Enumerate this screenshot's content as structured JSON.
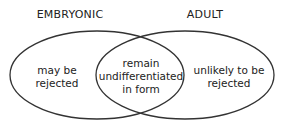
{
  "diagram": {
    "type": "venn",
    "sets": [
      {
        "label": "EMBRYONIC",
        "only_text": "may be rejected"
      },
      {
        "label": "ADULT",
        "only_text": "unlikely to be rejected"
      }
    ],
    "intersection_text": "remain undifferentiated in form"
  },
  "labels": {
    "left_title": "EMBRYONIC",
    "right_title": "ADULT",
    "left_line1": "may be",
    "left_line2": "rejected",
    "mid_line1": "remain",
    "mid_line2": "undifferentiated",
    "mid_line3": "in form",
    "right_line1": "unlikely to be",
    "right_line2": "rejected"
  }
}
